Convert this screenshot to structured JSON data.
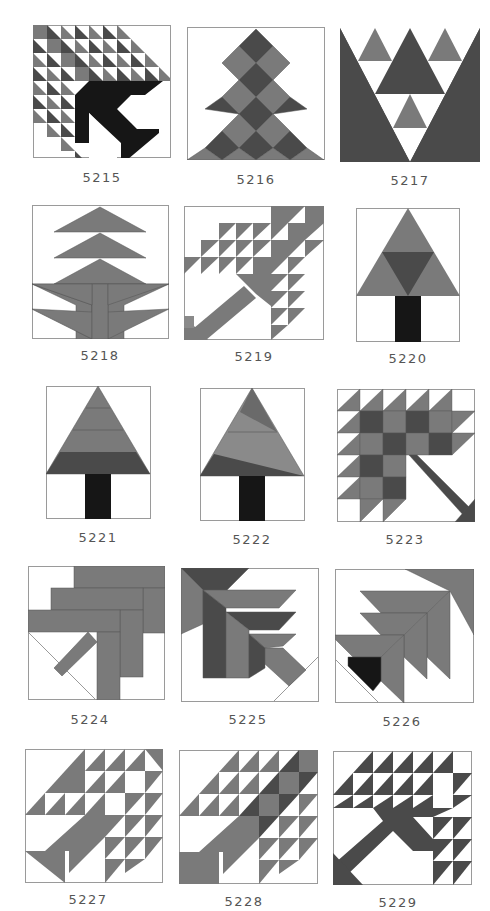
{
  "colors": {
    "white": "#ffffff",
    "gray": "#7a7a7a",
    "dark": "#4a4a4a",
    "black": "#161616",
    "outline": "#9a9a9a"
  },
  "blocks": [
    {
      "id": "5215",
      "label": "5215",
      "description": "Tree of triangles with dark trunk"
    },
    {
      "id": "5216",
      "label": "5216",
      "description": "Checkered diamond tree"
    },
    {
      "id": "5217",
      "label": "5217",
      "description": "Triangles in V shape"
    },
    {
      "id": "5218",
      "label": "5218",
      "description": "Tiered pine tree"
    },
    {
      "id": "5219",
      "label": "5219",
      "description": "Triangle tree with diagonal trunk"
    },
    {
      "id": "5220",
      "label": "5220",
      "description": "Triangle tree with inverted center"
    },
    {
      "id": "5221",
      "label": "5221",
      "description": "Striped pine tree"
    },
    {
      "id": "5222",
      "label": "5222",
      "description": "Angled striped pine tree"
    },
    {
      "id": "5223",
      "label": "5223",
      "description": "Checkered tree with diagonal trunk"
    },
    {
      "id": "5224",
      "label": "5224",
      "description": "Log strip tree"
    },
    {
      "id": "5225",
      "label": "5225",
      "description": "Nested chevron tree"
    },
    {
      "id": "5226",
      "label": "5226",
      "description": "Nested chevron tree with black base"
    },
    {
      "id": "5227",
      "label": "5227",
      "description": "Triangle tree, light"
    },
    {
      "id": "5228",
      "label": "5228",
      "description": "Triangle tree, shaded"
    },
    {
      "id": "5229",
      "label": "5229",
      "description": "Triangle tree, dark"
    }
  ]
}
